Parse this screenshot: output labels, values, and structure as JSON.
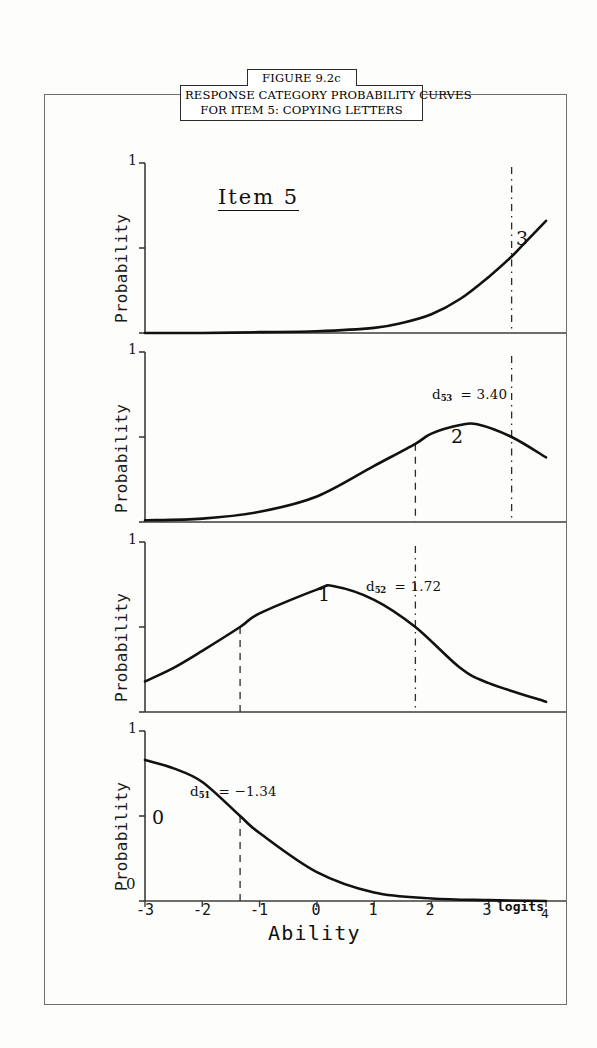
{
  "figure": {
    "number": "FIGURE 9.2c",
    "caption_line1": "RESPONSE CATEGORY PROBABILITY CURVES",
    "caption_line2": "FOR ITEM 5: COPYING LETTERS",
    "item_title": "Item 5"
  },
  "axes": {
    "y_label": "Probability",
    "y_tick_top": "1",
    "y_tick_bottom": "0",
    "x_title": "Ability",
    "x_units": "logits",
    "x_ticks": [
      "-3",
      "-2",
      "-1",
      "0",
      "1",
      "2",
      "3",
      "4"
    ]
  },
  "panels": [
    {
      "category_label": "3",
      "y_top_label": "1",
      "threshold_line_value": 3.4,
      "annotation": null,
      "annotation_sub": null,
      "annotation_value": null
    },
    {
      "category_label": "2",
      "y_top_label": "1",
      "threshold_line_value": 3.4,
      "annotation": "d",
      "annotation_sub": "53",
      "annotation_value": "= 3.40",
      "annotation_text": "d53 = 3.40",
      "second_line_value": 1.72
    },
    {
      "category_label": "1",
      "y_top_label": "1",
      "threshold_line_value": 1.72,
      "annotation": "d",
      "annotation_sub": "52",
      "annotation_value": "= 1.72",
      "annotation_text": "d52 = 1.72",
      "second_line_value": -1.34
    },
    {
      "category_label": "0",
      "y_top_label": "1",
      "y_bottom_label": "0",
      "threshold_line_value": -1.34,
      "annotation": "d",
      "annotation_sub": "51",
      "annotation_value": "= −1.34",
      "annotation_text": "d51 = −1.34"
    }
  ],
  "chart_data": {
    "type": "line",
    "title": "RESPONSE CATEGORY PROBABILITY CURVES FOR ITEM 5: COPYING LETTERS",
    "subtitle": "Item 5",
    "xlabel": "Ability",
    "ylabel": "Probability",
    "x_units": "logits",
    "xlim": [
      -3,
      4
    ],
    "ylim": [
      0,
      1
    ],
    "grid": false,
    "legend": "none",
    "thresholds": {
      "d51": -1.34,
      "d52": 1.72,
      "d53": 3.4
    },
    "panel_order": [
      "3",
      "2",
      "1",
      "0"
    ],
    "series": [
      {
        "name": "3",
        "panel": 1,
        "x": [
          -3,
          -2,
          -1,
          0,
          1,
          1.5,
          2,
          2.5,
          3,
          3.4,
          3.6,
          4
        ],
        "values": [
          0.0,
          0.0,
          0.005,
          0.01,
          0.03,
          0.06,
          0.11,
          0.2,
          0.33,
          0.45,
          0.52,
          0.66
        ]
      },
      {
        "name": "2",
        "panel": 2,
        "x": [
          -3,
          -2,
          -1,
          0,
          1,
          1.72,
          2,
          2.5,
          2.8,
          3.4,
          4
        ],
        "values": [
          0.01,
          0.02,
          0.06,
          0.15,
          0.33,
          0.46,
          0.52,
          0.57,
          0.575,
          0.5,
          0.38
        ]
      },
      {
        "name": "1",
        "panel": 3,
        "x": [
          -3,
          -2.5,
          -2,
          -1.34,
          -1,
          0,
          0.3,
          1,
          1.72,
          2.5,
          3,
          4
        ],
        "values": [
          0.18,
          0.26,
          0.36,
          0.5,
          0.58,
          0.72,
          0.74,
          0.66,
          0.5,
          0.26,
          0.17,
          0.06
        ]
      },
      {
        "name": "0",
        "panel": 4,
        "x": [
          -3,
          -2.5,
          -2,
          -1.34,
          -1,
          0,
          1,
          2,
          3,
          4
        ],
        "values": [
          0.83,
          0.78,
          0.7,
          0.5,
          0.4,
          0.17,
          0.05,
          0.015,
          0.005,
          0.0
        ]
      }
    ]
  }
}
